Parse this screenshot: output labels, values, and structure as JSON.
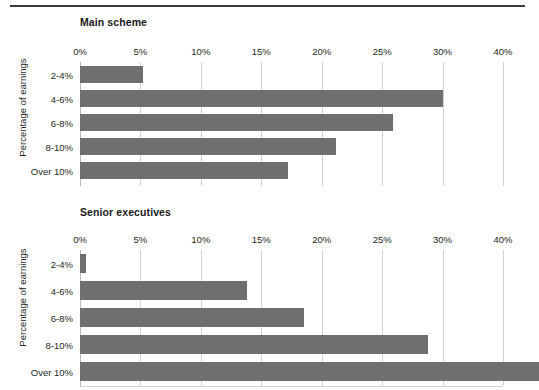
{
  "figure": {
    "divider": "top-rule",
    "bar_color": "#706f6f",
    "gridline_color": "#d2d2d2",
    "background": "#ffffff"
  },
  "chart_data": [
    {
      "type": "bar",
      "orientation": "horizontal",
      "title": "Main scheme",
      "xlabel": "",
      "ylabel": "Percentage of earnings",
      "categories": [
        "2-4%",
        "4-6%",
        "6-8%",
        "8-10%",
        "Over 10%"
      ],
      "values": [
        5.2,
        30.0,
        25.9,
        21.2,
        17.2
      ],
      "tick_labels": [
        "0%",
        "5%",
        "10%",
        "15%",
        "20%",
        "25%",
        "30%",
        "40%"
      ],
      "tick_values": [
        0,
        5,
        10,
        15,
        20,
        25,
        30,
        35
      ],
      "xlim": [
        0,
        35
      ],
      "grid": true,
      "legend": "none"
    },
    {
      "type": "bar",
      "orientation": "horizontal",
      "title": "Senior executives",
      "xlabel": "",
      "ylabel": "Percentage of earnings",
      "categories": [
        "2-4%",
        "4-6%",
        "6-8%",
        "8-10%",
        "Over 10%"
      ],
      "values": [
        0.5,
        13.8,
        18.5,
        28.8,
        38.0
      ],
      "tick_labels": [
        "0%",
        "5%",
        "10%",
        "15%",
        "20%",
        "25%",
        "30%",
        "40%"
      ],
      "tick_values": [
        0,
        5,
        10,
        15,
        20,
        25,
        30,
        35
      ],
      "xlim": [
        0,
        35
      ],
      "grid": true,
      "legend": "none"
    }
  ]
}
